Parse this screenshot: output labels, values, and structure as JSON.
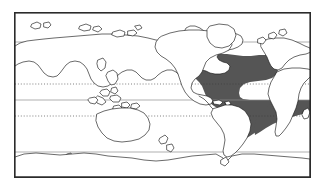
{
  "figure": {
    "kind": "distribution-map",
    "title": "",
    "caption": "",
    "background_color": "#ffffff"
  },
  "map": {
    "projection": "equirectangular",
    "center_longitude": 160,
    "frame": {
      "x": 14,
      "y": 12,
      "width": 297,
      "height": 166,
      "border_color": "#2b2b2b"
    },
    "land_fill_color": "#ffffff",
    "coastline_color": "#1a1a1a",
    "latitude_lines": [
      {
        "name": "arctic-circle",
        "label": "",
        "style": "solid",
        "color": "#8c8c8c",
        "y": 30
      },
      {
        "name": "tropic-of-cancer",
        "label": "",
        "style": "dotted",
        "color": "#3a3a3a",
        "y": 72
      },
      {
        "name": "equator",
        "label": "",
        "style": "solid",
        "color": "#8c8c8c",
        "y": 88
      },
      {
        "name": "tropic-of-capricorn",
        "label": "",
        "style": "dotted",
        "color": "#3a3a3a",
        "y": 104
      },
      {
        "name": "antarctic-circle",
        "label": "",
        "style": "solid",
        "color": "#8c8c8c",
        "y": 140
      }
    ],
    "range_overlay": {
      "label": "",
      "region": "tropical-atlantic-ocean",
      "fill_color": "#555555",
      "legend_text": ""
    }
  }
}
